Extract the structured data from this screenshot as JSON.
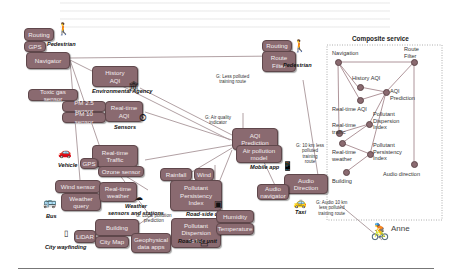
{
  "diagram": {
    "boxes": {
      "routing_ped": "Routing",
      "gps_ped": "GPS",
      "navigator": "Navigator",
      "history_aqi": "History\nAQI",
      "toxic_gas": "Toxic gas sensor",
      "pm25": "PM 2.5 sensor",
      "pm10": "PM 10 sensor",
      "realtime_aqi": "Real-time\nAQI",
      "realtime_traffic": "Real-time\nTraffic",
      "gps_vehicle": "GPS",
      "ozone": "Ozone sensor",
      "rainfall": "Rainfall",
      "wind": "Wind",
      "ppi": "Pollutant\nPersistency\nIndex",
      "wind_sensor": "Wind sensor",
      "realtime_weather": "Real-time\nweather",
      "weather_query": "Weather\nquery",
      "pdi": "Pollutant\nDispersion\nIndex",
      "humidity": "Humidity",
      "temperature": "Temperature",
      "lidar": "LiDAR",
      "building": "Building",
      "city_map": "City Map",
      "geo_data": "Geophysical\ndata apps",
      "routing_top": "Routing",
      "route_filter": "Route\nFilter",
      "aqi_prediction": "AQI\nPrediction",
      "air_pollution_model": "Air pollution\nmodel",
      "audio_direction": "Audio\nDirection",
      "audio_navigator": "Audio\nnavigator"
    },
    "labels": {
      "pedestrian_left": "Pedestrian",
      "pedestrian_right": "Pedestrian",
      "env_agency": "Environmental Agency",
      "sensors": "Sensors",
      "vehicle": "Vehicle",
      "roadside1": "Road-side unit",
      "roadside2": "Road-side unit",
      "weather_stations": "Weather\nsensors and stations",
      "bus": "Bus",
      "city_wayfinding": "City wayfinding",
      "mobile_app": "Mobile app",
      "taxi": "Taxi",
      "anne": "Anne"
    },
    "goals": {
      "less_polluted": "G: Less polluted\ntraining route",
      "air_quality": "G: Air quality\nindicator",
      "local_pollution": "G: Local pollution\nprediction",
      "ten_km": "G: 10 km less\npolluted\ntraining\nroute",
      "audio_ten_km": "G: Audio 10 km\nless polluted\ntraining route"
    },
    "composite": {
      "title": "Composite service",
      "nodes": {
        "navigation": "Navigation",
        "route_filter": "Route\nFilter",
        "history_aqi": "History AQI",
        "aqi_prediction": "AQI\nPrediction",
        "realtime_aqi": "Real-time AQI",
        "pdi": "Pollutant\nDispersion\nIndex",
        "realtime_traffic": "Real-time\ntraffic",
        "ppi": "Pollutant\nPersistency\nIndex",
        "realtime_weather": "Real-time\nweather",
        "building": "Building",
        "audio_direction": "Audio direction"
      }
    }
  },
  "colors": {
    "box": "#8a6a70",
    "border": "#5f474b",
    "line": "#9a8a8d"
  }
}
